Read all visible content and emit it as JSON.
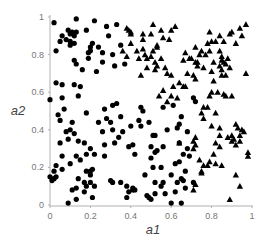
{
  "chart_data": {
    "type": "scatter",
    "title": "",
    "xlabel": "a1",
    "ylabel": "a2",
    "xlim": [
      0,
      1
    ],
    "ylim": [
      0,
      1
    ],
    "grid": false,
    "legend": null,
    "x_ticks": [
      "0",
      "0.2",
      "0.4",
      "0.6",
      "0.8",
      "1"
    ],
    "y_ticks": [
      "0",
      "0.2",
      "0.4",
      "0.6",
      "0.8",
      "1"
    ],
    "series": [
      {
        "name": "circles",
        "marker": "circle",
        "color": "#000000",
        "points": [
          [
            0.02,
            0.97
          ],
          [
            0.13,
            0.99
          ],
          [
            0.22,
            0.98
          ],
          [
            0.28,
            0.95
          ],
          [
            0.33,
            0.96
          ],
          [
            0.06,
            0.9
          ],
          [
            0.09,
            0.93
          ],
          [
            0.1,
            0.91
          ],
          [
            0.11,
            0.92
          ],
          [
            0.12,
            0.9
          ],
          [
            0.13,
            0.92
          ],
          [
            0.08,
            0.88
          ],
          [
            0.1,
            0.87
          ],
          [
            0.12,
            0.86
          ],
          [
            0.1,
            0.85
          ],
          [
            0.05,
            0.87
          ],
          [
            0.18,
            0.93
          ],
          [
            0.29,
            0.9
          ],
          [
            0.03,
            0.82
          ],
          [
            0.2,
            0.82
          ],
          [
            0.2,
            0.84
          ],
          [
            0.21,
            0.86
          ],
          [
            0.24,
            0.84
          ],
          [
            0.26,
            0.81
          ],
          [
            0.19,
            0.81
          ],
          [
            0.31,
            0.8
          ],
          [
            0.35,
            0.85
          ],
          [
            0.12,
            0.77
          ],
          [
            0.19,
            0.78
          ],
          [
            0.26,
            0.76
          ],
          [
            0.13,
            0.75
          ],
          [
            0.16,
            0.72
          ],
          [
            0.23,
            0.71
          ],
          [
            0.32,
            0.74
          ],
          [
            0.37,
            0.75
          ],
          [
            0.03,
            0.65
          ],
          [
            0.06,
            0.64
          ],
          [
            0.12,
            0.64
          ],
          [
            0.15,
            0.63
          ],
          [
            0.0,
            0.56
          ],
          [
            0.06,
            0.57
          ],
          [
            0.14,
            0.58
          ],
          [
            0.07,
            0.51
          ],
          [
            0.18,
            0.49
          ],
          [
            0.27,
            0.51
          ],
          [
            0.31,
            0.53
          ],
          [
            0.33,
            0.54
          ],
          [
            0.05,
            0.45
          ],
          [
            0.11,
            0.44
          ],
          [
            0.28,
            0.46
          ],
          [
            0.35,
            0.47
          ],
          [
            0.24,
            0.44
          ],
          [
            0.3,
            0.44
          ],
          [
            0.04,
            0.48
          ],
          [
            0.08,
            0.39
          ],
          [
            0.1,
            0.4
          ],
          [
            0.12,
            0.38
          ],
          [
            0.09,
            0.35
          ],
          [
            0.14,
            0.34
          ],
          [
            0.17,
            0.33
          ],
          [
            0.2,
            0.3
          ],
          [
            0.05,
            0.33
          ],
          [
            0.22,
            0.27
          ],
          [
            0.27,
            0.26
          ],
          [
            0.13,
            0.26
          ],
          [
            0.15,
            0.24
          ],
          [
            0.18,
            0.27
          ],
          [
            0.1,
            0.22
          ],
          [
            0.06,
            0.26
          ],
          [
            0.03,
            0.21
          ],
          [
            0.02,
            0.18
          ],
          [
            0.06,
            0.19
          ],
          [
            0.18,
            0.18
          ],
          [
            0.2,
            0.18
          ],
          [
            0.2,
            0.16
          ],
          [
            0.21,
            0.19
          ],
          [
            0.0,
            0.15
          ],
          [
            0.02,
            0.14
          ],
          [
            0.03,
            0.15
          ],
          [
            0.01,
            0.13
          ],
          [
            0.14,
            0.14
          ],
          [
            0.17,
            0.12
          ],
          [
            0.18,
            0.1
          ],
          [
            0.2,
            0.12
          ],
          [
            0.22,
            0.1
          ],
          [
            0.11,
            0.08
          ],
          [
            0.13,
            0.09
          ],
          [
            0.17,
            0.07
          ],
          [
            0.21,
            0.04
          ],
          [
            0.13,
            0.03
          ],
          [
            0.09,
            0.01
          ],
          [
            0.26,
            0.39
          ],
          [
            0.31,
            0.4
          ],
          [
            0.36,
            0.39
          ],
          [
            0.34,
            0.36
          ],
          [
            0.27,
            0.32
          ],
          [
            0.32,
            0.33
          ],
          [
            0.4,
            0.42
          ],
          [
            0.39,
            0.31
          ],
          [
            0.41,
            0.32
          ],
          [
            0.42,
            0.27
          ],
          [
            0.3,
            0.13
          ],
          [
            0.31,
            0.12
          ],
          [
            0.35,
            0.12
          ],
          [
            0.38,
            0.1
          ],
          [
            0.39,
            0.07
          ],
          [
            0.41,
            0.08
          ],
          [
            0.41,
            0.09
          ],
          [
            0.44,
            0.45
          ],
          [
            0.49,
            0.44
          ],
          [
            0.45,
            0.42
          ],
          [
            0.51,
            0.37
          ],
          [
            0.52,
            0.37
          ],
          [
            0.5,
            0.31
          ],
          [
            0.56,
            0.31
          ],
          [
            0.58,
            0.4
          ],
          [
            0.63,
            0.41
          ],
          [
            0.64,
            0.43
          ],
          [
            0.65,
            0.47
          ],
          [
            0.52,
            0.28
          ],
          [
            0.53,
            0.29
          ],
          [
            0.5,
            0.25
          ],
          [
            0.55,
            0.2
          ],
          [
            0.51,
            0.2
          ],
          [
            0.6,
            0.16
          ],
          [
            0.63,
            0.12
          ],
          [
            0.65,
            0.14
          ],
          [
            0.66,
            0.13
          ],
          [
            0.67,
            0.09
          ],
          [
            0.71,
            0.12
          ],
          [
            0.62,
            0.07
          ],
          [
            0.57,
            0.06
          ],
          [
            0.52,
            0.06
          ],
          [
            0.48,
            0.05
          ],
          [
            0.49,
            0.04
          ],
          [
            0.38,
            0.04
          ],
          [
            0.42,
            0.08
          ],
          [
            0.56,
            0.52
          ],
          [
            0.61,
            0.53
          ],
          [
            0.72,
            0.55
          ],
          [
            0.71,
            0.57
          ],
          [
            0.46,
            0.5
          ],
          [
            0.45,
            0.52
          ],
          [
            0.68,
            0.39
          ],
          [
            0.64,
            0.33
          ],
          [
            0.68,
            0.3
          ],
          [
            0.69,
            0.26
          ],
          [
            0.66,
            0.27
          ],
          [
            0.64,
            0.23
          ],
          [
            0.62,
            0.22
          ],
          [
            0.67,
            0.18
          ],
          [
            0.47,
            0.16
          ],
          [
            0.52,
            0.12
          ],
          [
            0.56,
            0.12
          ],
          [
            0.55,
            0.1
          ],
          [
            0.6,
            0.01
          ],
          [
            0.65,
            0.01
          ],
          [
            0.5,
            0.03
          ]
        ]
      },
      {
        "name": "triangles",
        "marker": "triangle",
        "color": "#000000",
        "points": [
          [
            0.39,
            0.93
          ],
          [
            0.4,
            0.92
          ],
          [
            0.4,
            0.91
          ],
          [
            0.38,
            0.94
          ],
          [
            0.46,
            0.91
          ],
          [
            0.4,
            0.86
          ],
          [
            0.43,
            0.82
          ],
          [
            0.44,
            0.78
          ],
          [
            0.48,
            0.78
          ],
          [
            0.48,
            0.73
          ],
          [
            0.45,
            0.69
          ],
          [
            0.38,
            0.79
          ],
          [
            0.36,
            0.82
          ],
          [
            0.51,
            0.96
          ],
          [
            0.55,
            0.93
          ],
          [
            0.6,
            0.93
          ],
          [
            0.62,
            0.95
          ],
          [
            0.5,
            0.91
          ],
          [
            0.56,
            0.89
          ],
          [
            0.59,
            0.88
          ],
          [
            0.53,
            0.85
          ],
          [
            0.51,
            0.82
          ],
          [
            0.5,
            0.79
          ],
          [
            0.55,
            0.78
          ],
          [
            0.53,
            0.74
          ],
          [
            0.52,
            0.76
          ],
          [
            0.46,
            0.83
          ],
          [
            0.47,
            0.8
          ],
          [
            0.53,
            0.84
          ],
          [
            0.46,
            0.88
          ],
          [
            0.57,
            0.73
          ],
          [
            0.52,
            0.72
          ],
          [
            0.58,
            0.7
          ],
          [
            0.6,
            0.69
          ],
          [
            0.68,
            0.7
          ],
          [
            0.67,
            0.63
          ],
          [
            0.64,
            0.65
          ],
          [
            0.61,
            0.63
          ],
          [
            0.6,
            0.58
          ],
          [
            0.63,
            0.57
          ],
          [
            0.66,
            0.63
          ],
          [
            0.56,
            0.61
          ],
          [
            0.58,
            0.55
          ],
          [
            0.54,
            0.58
          ],
          [
            0.79,
            0.92
          ],
          [
            0.84,
            0.9
          ],
          [
            0.89,
            0.91
          ],
          [
            0.94,
            0.94
          ],
          [
            0.97,
            0.96
          ],
          [
            0.9,
            0.92
          ],
          [
            0.95,
            0.9
          ],
          [
            0.8,
            0.87
          ],
          [
            0.82,
            0.87
          ],
          [
            0.86,
            0.87
          ],
          [
            0.92,
            0.86
          ],
          [
            0.79,
            0.82
          ],
          [
            0.84,
            0.82
          ],
          [
            0.81,
            0.76
          ],
          [
            0.85,
            0.79
          ],
          [
            0.86,
            0.76
          ],
          [
            0.88,
            0.78
          ],
          [
            0.89,
            0.73
          ],
          [
            0.87,
            0.75
          ],
          [
            0.84,
            0.74
          ],
          [
            0.8,
            0.71
          ],
          [
            0.85,
            0.72
          ],
          [
            0.85,
            0.69
          ],
          [
            0.87,
            0.69
          ],
          [
            0.85,
            0.77
          ],
          [
            0.97,
            0.7
          ],
          [
            0.74,
            0.8
          ],
          [
            0.75,
            0.82
          ],
          [
            0.77,
            0.8
          ],
          [
            0.72,
            0.76
          ],
          [
            0.73,
            0.74
          ],
          [
            0.76,
            0.73
          ],
          [
            0.81,
            0.66
          ],
          [
            0.79,
            0.58
          ],
          [
            0.8,
            0.6
          ],
          [
            0.83,
            0.6
          ],
          [
            0.86,
            0.59
          ],
          [
            0.87,
            0.58
          ],
          [
            0.9,
            0.58
          ],
          [
            0.71,
            0.69
          ],
          [
            0.72,
            0.67
          ],
          [
            0.78,
            0.52
          ],
          [
            0.76,
            0.52
          ],
          [
            0.82,
            0.49
          ],
          [
            0.75,
            0.49
          ],
          [
            0.76,
            0.46
          ],
          [
            0.8,
            0.42
          ],
          [
            0.84,
            0.41
          ],
          [
            0.66,
            0.77
          ],
          [
            0.69,
            0.78
          ],
          [
            0.67,
            0.81
          ],
          [
            0.72,
            0.84
          ],
          [
            0.78,
            0.86
          ],
          [
            0.7,
            0.78
          ],
          [
            0.73,
            0.76
          ],
          [
            0.84,
            0.37
          ],
          [
            0.88,
            0.36
          ],
          [
            0.9,
            0.37
          ],
          [
            0.94,
            0.37
          ],
          [
            0.95,
            0.4
          ],
          [
            0.94,
            0.34
          ],
          [
            0.92,
            0.32
          ],
          [
            0.9,
            0.34
          ],
          [
            0.84,
            0.31
          ],
          [
            0.82,
            0.33
          ],
          [
            0.91,
            0.35
          ],
          [
            0.98,
            0.28
          ],
          [
            0.98,
            0.26
          ],
          [
            0.81,
            0.27
          ],
          [
            0.64,
            0.33
          ],
          [
            0.71,
            0.34
          ],
          [
            0.72,
            0.36
          ],
          [
            0.72,
            0.32
          ],
          [
            0.71,
            0.3
          ],
          [
            0.74,
            0.24
          ],
          [
            0.76,
            0.21
          ],
          [
            0.79,
            0.23
          ],
          [
            0.78,
            0.21
          ],
          [
            0.75,
            0.17
          ],
          [
            0.72,
            0.11
          ],
          [
            0.71,
            0.08
          ],
          [
            0.82,
            0.22
          ],
          [
            0.85,
            0.21
          ],
          [
            0.92,
            0.16
          ],
          [
            0.94,
            0.1
          ],
          [
            0.89,
            0.03
          ],
          [
            0.75,
            0.18
          ],
          [
            0.92,
            0.43
          ],
          [
            0.93,
            0.41
          ],
          [
            0.96,
            0.39
          ]
        ]
      }
    ]
  }
}
